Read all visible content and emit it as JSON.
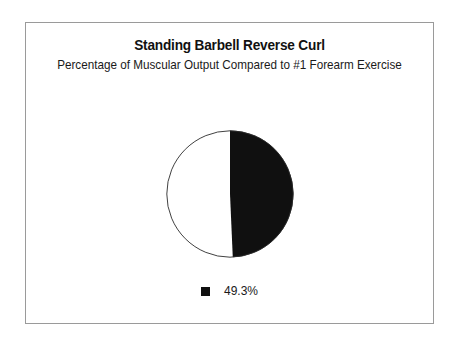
{
  "chart_data": {
    "type": "pie",
    "title": "Standing Barbell Reverse Curl",
    "subtitle": "Percentage of Muscular Output Compared to #1 Forearm Exercise",
    "categories": [
      "49.3%",
      ""
    ],
    "values": [
      49.3,
      50.7
    ],
    "labels": [
      "49.3%"
    ],
    "slice_colors": [
      "#101010",
      "#ffffff"
    ],
    "start_angle_deg": 0,
    "direction": "clockwise",
    "legend": {
      "position": "bottom",
      "entries": [
        {
          "label": "49.3%",
          "color": "#101010"
        }
      ]
    },
    "grid": false,
    "xlabel": "",
    "ylabel": ""
  },
  "frame": {
    "border_color": "#9a9a9a",
    "background": "#ffffff"
  },
  "pie": {
    "outline_color": "#2b2b2b",
    "slice_fill": "#101010",
    "remainder_fill": "#ffffff"
  }
}
